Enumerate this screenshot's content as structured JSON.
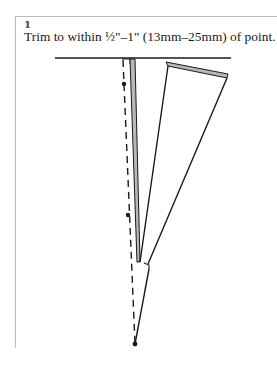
{
  "step": {
    "number": "1",
    "instruction": "Trim to within ½\"–1\" (13mm–25mm) of point."
  },
  "illustration": {
    "subject": "dart-fold-trimmed-to-point",
    "colors": {
      "line": "#1a1a1a",
      "fold_fill": "#b8b8b8",
      "frame_border": "#bdbdbd",
      "background": "#ffffff"
    },
    "elements": [
      "seamline-top",
      "dashed-dart-leg",
      "dart-fold-edge",
      "trimmed-flap",
      "dart-point"
    ]
  }
}
